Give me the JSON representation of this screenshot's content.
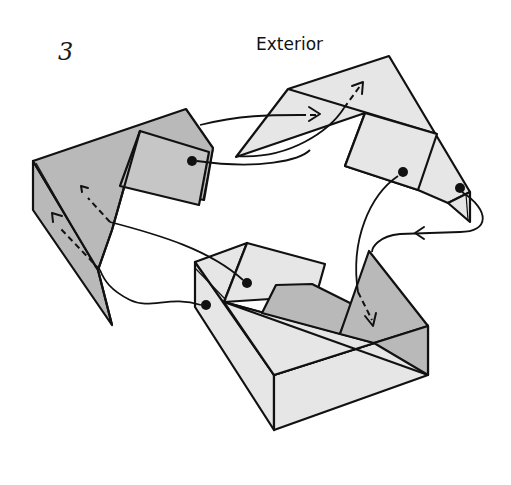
{
  "diagram": {
    "step_number": "3",
    "label": "Exterior",
    "colors": {
      "background": "#ffffff",
      "dark_paper": "#b9b9b9",
      "mid_paper": "#c6c6c6",
      "light_paper": "#e6e6e6",
      "line": "#111111"
    },
    "units": [
      {
        "name": "left-unit",
        "shade": "dark"
      },
      {
        "name": "top-right-unit",
        "shade": "light"
      },
      {
        "name": "bottom-box-unit",
        "shade": "light"
      }
    ],
    "connectors": [
      {
        "from": "left-unit-dot",
        "to": "top-right-unit",
        "style": "solid-curve-then-dashed-arrow"
      },
      {
        "from": "top-right-unit-dot-inner",
        "to": "bottom-box-unit-flap",
        "style": "solid-curve-then-dashed-arrow"
      },
      {
        "from": "top-right-unit-dot-tip",
        "to": "bottom-box-unit-flap",
        "style": "solid-curve-with-arrow"
      },
      {
        "from": "bottom-box-unit-dot-upper",
        "to": "left-unit",
        "style": "solid-line-then-dashed-arrow"
      },
      {
        "from": "bottom-box-unit-dot-lower",
        "to": "left-unit",
        "style": "solid-curve-then-dashed-arrow"
      }
    ]
  }
}
